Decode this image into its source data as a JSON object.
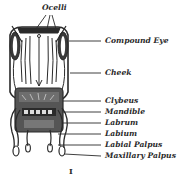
{
  "figure": {
    "number": "I"
  },
  "labels": [
    {
      "id": "ocelli",
      "text": "Ocelli"
    },
    {
      "id": "compound-eye",
      "text": "Compound Eye"
    },
    {
      "id": "cheek",
      "text": "Cheek"
    },
    {
      "id": "clybeus",
      "text": "Clybeus"
    },
    {
      "id": "mandible",
      "text": "Mandible"
    },
    {
      "id": "labrum",
      "text": "Labrum"
    },
    {
      "id": "labium",
      "text": "Labium"
    },
    {
      "id": "labial-palpus",
      "text": "Labial Palpus"
    },
    {
      "id": "maxillary-palpus",
      "text": "Maxillary Palpus"
    }
  ],
  "colors": {
    "ink": "#2a2a2a",
    "background": "#ffffff"
  }
}
